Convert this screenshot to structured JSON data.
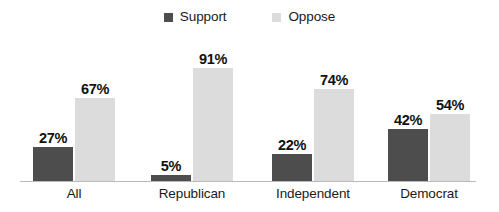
{
  "chart_data": {
    "type": "bar",
    "title": "",
    "subtitle": "",
    "xlabel": "",
    "ylabel": "",
    "ylim": [
      0,
      100
    ],
    "grid": false,
    "legend_position": "top-center",
    "categories": [
      "All",
      "Republican",
      "Independent",
      "Democrat"
    ],
    "series": [
      {
        "name": "Support",
        "color": "#4d4d4d",
        "values": [
          27,
          5,
          22,
          42
        ],
        "labels": [
          "27%",
          "5%",
          "22%",
          "42%"
        ]
      },
      {
        "name": "Oppose",
        "color": "#dcdcdc",
        "values": [
          67,
          91,
          74,
          54
        ],
        "labels": [
          "67%",
          "91%",
          "74%",
          "54%"
        ]
      }
    ],
    "annotations": []
  },
  "legend": {
    "entries": [
      {
        "label": "Support",
        "color": "#4d4d4d"
      },
      {
        "label": "Oppose",
        "color": "#dcdcdc"
      }
    ]
  },
  "axis": {
    "baseline_color": "#b9b9b9"
  },
  "colors": {
    "support": "#4d4d4d",
    "oppose": "#dcdcdc",
    "text": "#1a1a1a",
    "value_text": "#111111",
    "background": "#ffffff"
  }
}
